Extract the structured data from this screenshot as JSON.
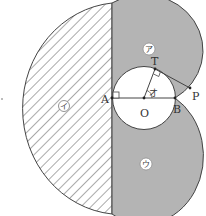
{
  "figure": {
    "points": {
      "A": "A",
      "O": "O",
      "B": "B",
      "T": "T",
      "P": "P"
    },
    "angle_label": "オ",
    "regions": {
      "upper": "ア",
      "left": "イ",
      "lower": "ウ"
    },
    "colors": {
      "shaded": "#b4b4b4",
      "hatch": "#555555",
      "line": "#444444",
      "background": "#ffffff"
    }
  }
}
